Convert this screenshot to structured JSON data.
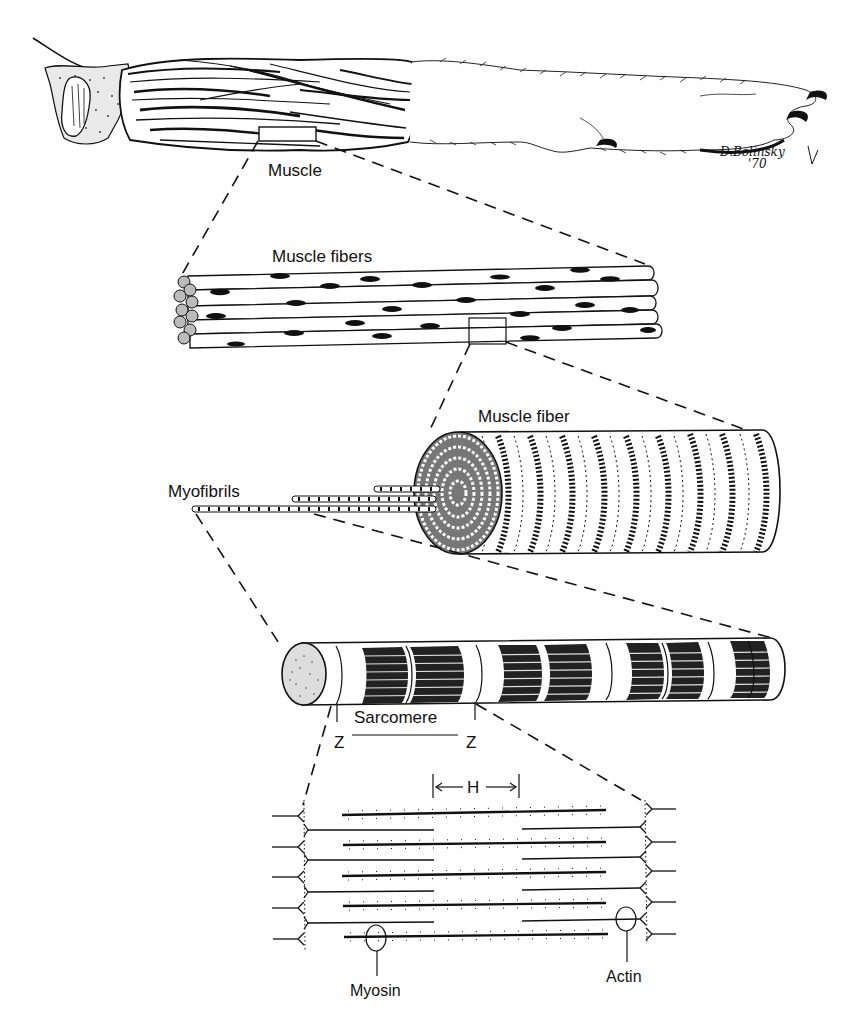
{
  "figure": {
    "colors": {
      "ink": "#111111",
      "paper": "#ffffff"
    },
    "levels": [
      {
        "id": "muscle",
        "label": "Muscle"
      },
      {
        "id": "muscle-fibers",
        "label": "Muscle fibers"
      },
      {
        "id": "muscle-fiber",
        "label": "Muscle fiber"
      },
      {
        "id": "myofibrils",
        "label": "Myofibrils"
      },
      {
        "id": "myofibril",
        "label": "Sarcomere"
      },
      {
        "id": "filaments",
        "label": "Filaments"
      }
    ],
    "labels": {
      "muscle": "Muscle",
      "muscle_fibers": "Muscle fibers",
      "muscle_fiber": "Muscle fiber",
      "myofibrils": "Myofibrils",
      "sarcomere": "Sarcomere",
      "z_left": "Z",
      "z_right": "Z",
      "h_band": "H",
      "myosin": "Myosin",
      "actin": "Actin"
    },
    "signature": {
      "name": "D.Bolinsky",
      "year": "'70"
    }
  }
}
